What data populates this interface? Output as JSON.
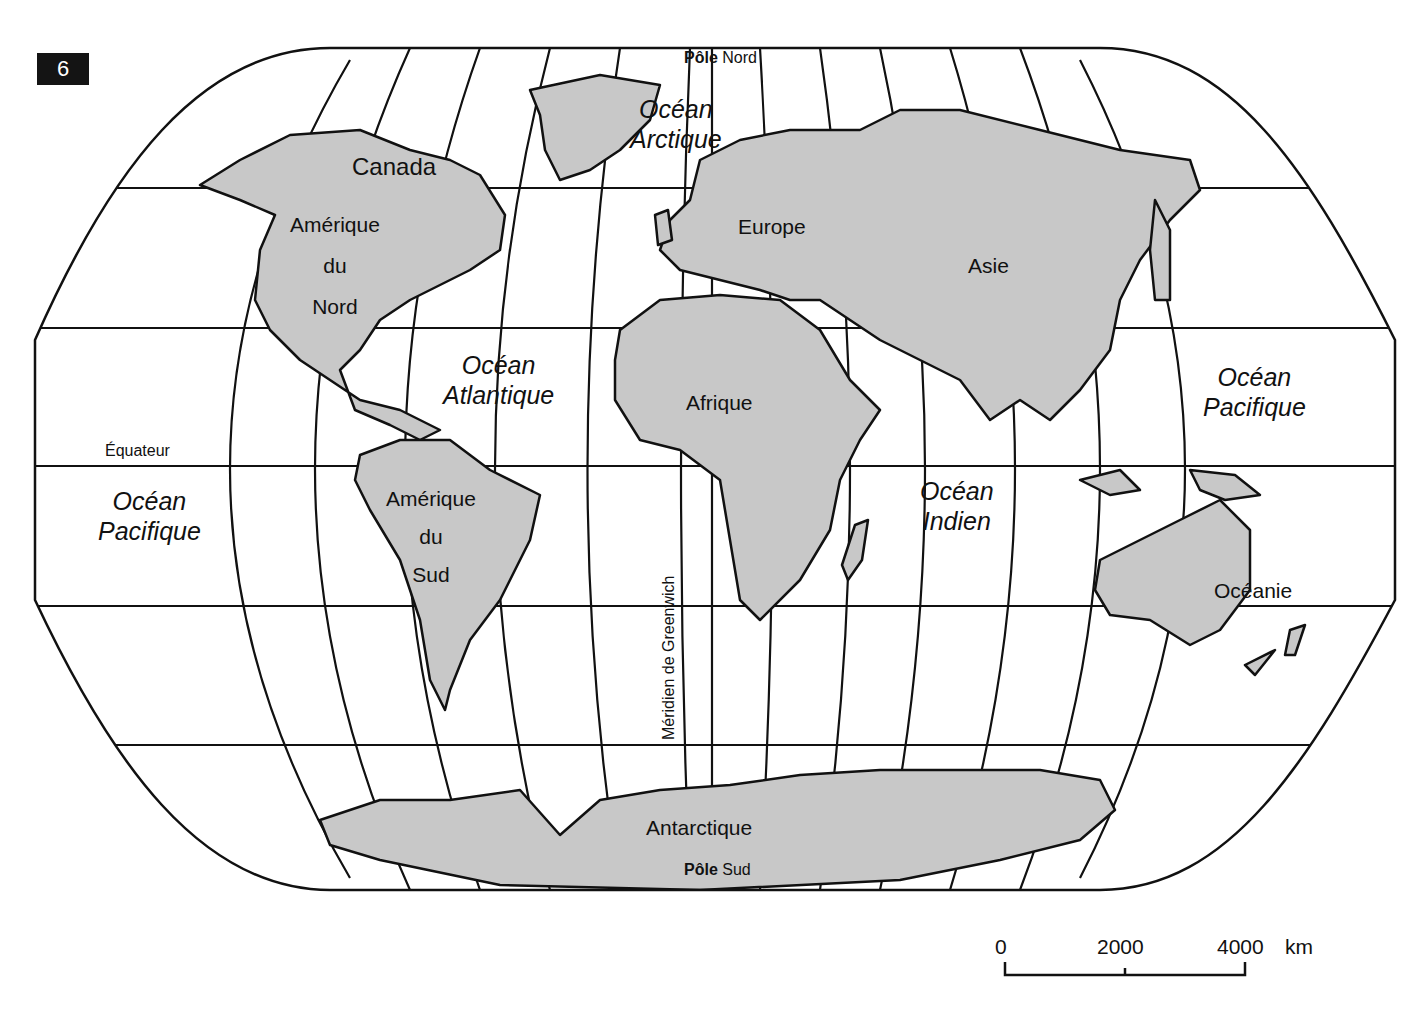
{
  "figure_number": "6",
  "poles": {
    "north": {
      "bold": "Pôle",
      "rest": "Nord"
    },
    "south": {
      "bold": "Pôle",
      "rest": "Sud"
    }
  },
  "lines": {
    "equator": "Équateur",
    "greenwich": "Méridien de Greenwich"
  },
  "continents": {
    "canada": "Canada",
    "north_america": [
      "Amérique",
      "du",
      "Nord"
    ],
    "south_america": [
      "Amérique",
      "du",
      "Sud"
    ],
    "europe": "Europe",
    "asia": "Asie",
    "africa": "Afrique",
    "oceania": "Océanie",
    "antarctica": "Antarctique"
  },
  "oceans": {
    "arctic": [
      "Océan",
      "Arctique"
    ],
    "atlantic": [
      "Océan",
      "Atlantique"
    ],
    "indian": [
      "Océan",
      "Indien"
    ],
    "pacific_west": [
      "Océan",
      "Pacifique"
    ],
    "pacific_east": [
      "Océan",
      "Pacifique"
    ]
  },
  "scale_bar": {
    "ticks": [
      "0",
      "2000",
      "4000"
    ],
    "unit": "km"
  },
  "colors": {
    "land": "#c8c8c8",
    "water": "#ffffff",
    "outline": "#111111"
  }
}
